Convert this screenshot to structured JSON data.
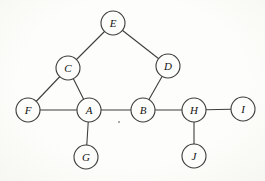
{
  "diagram": {
    "type": "undirected-graph",
    "background_color": "#fbfbf8",
    "node_fill": "#fdfdfb",
    "node_stroke": "#3d3d3d",
    "node_stroke_width": 1.1,
    "edge_stroke": "#3d3d3d",
    "edge_stroke_width": 1.1,
    "label_color": "#141414",
    "node_radius": 12,
    "nodes": [
      {
        "id": "E",
        "label": "E",
        "x": 113,
        "y": 23
      },
      {
        "id": "C",
        "label": "C",
        "x": 68,
        "y": 68
      },
      {
        "id": "D",
        "label": "D",
        "x": 168,
        "y": 66
      },
      {
        "id": "F",
        "label": "F",
        "x": 28,
        "y": 110
      },
      {
        "id": "A",
        "label": "A",
        "x": 89,
        "y": 110
      },
      {
        "id": "B",
        "label": "B",
        "x": 143,
        "y": 110
      },
      {
        "id": "H",
        "label": "H",
        "x": 194,
        "y": 110
      },
      {
        "id": "I",
        "label": "I",
        "x": 243,
        "y": 109
      },
      {
        "id": "G",
        "label": "G",
        "x": 86,
        "y": 157
      },
      {
        "id": "J",
        "label": "J",
        "x": 194,
        "y": 156
      }
    ],
    "edges": [
      {
        "from": "E",
        "to": "C"
      },
      {
        "from": "E",
        "to": "D"
      },
      {
        "from": "C",
        "to": "F"
      },
      {
        "from": "C",
        "to": "A"
      },
      {
        "from": "F",
        "to": "A"
      },
      {
        "from": "A",
        "to": "B"
      },
      {
        "from": "A",
        "to": "G"
      },
      {
        "from": "D",
        "to": "B"
      },
      {
        "from": "B",
        "to": "H"
      },
      {
        "from": "H",
        "to": "I"
      },
      {
        "from": "H",
        "to": "J"
      }
    ],
    "artifact_speck": {
      "x": 119,
      "y": 122,
      "r": 1,
      "color": "#8f8f88"
    }
  }
}
